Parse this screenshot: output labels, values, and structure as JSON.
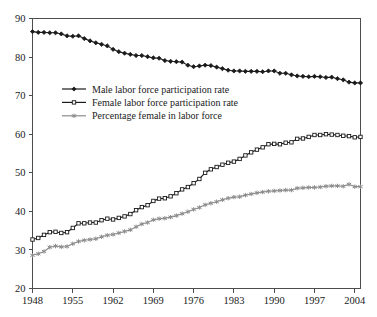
{
  "chart_data": {
    "type": "line",
    "title": "",
    "subtitle": "",
    "xlabel": "",
    "ylabel": "",
    "xlim": [
      1948,
      2005
    ],
    "ylim": [
      20,
      90
    ],
    "grid": false,
    "legend_position": "inside-upper-left",
    "x_ticks": [
      "1948",
      "1955",
      "1962",
      "1969",
      "1976",
      "1983",
      "1990",
      "1997",
      "2004"
    ],
    "x_tick_values": [
      1948,
      1955,
      1962,
      1969,
      1976,
      1983,
      1990,
      1997,
      2004
    ],
    "y_ticks": [
      "20",
      "30",
      "40",
      "50",
      "60",
      "70",
      "80",
      "90"
    ],
    "y_tick_values": [
      20,
      30,
      40,
      50,
      60,
      70,
      80,
      90
    ],
    "x": [
      1948,
      1949,
      1950,
      1951,
      1952,
      1953,
      1954,
      1955,
      1956,
      1957,
      1958,
      1959,
      1960,
      1961,
      1962,
      1963,
      1964,
      1965,
      1966,
      1967,
      1968,
      1969,
      1970,
      1971,
      1972,
      1973,
      1974,
      1975,
      1976,
      1977,
      1978,
      1979,
      1980,
      1981,
      1982,
      1983,
      1984,
      1985,
      1986,
      1987,
      1988,
      1989,
      1990,
      1991,
      1992,
      1993,
      1994,
      1995,
      1996,
      1997,
      1998,
      1999,
      2000,
      2001,
      2002,
      2003,
      2004,
      2005
    ],
    "series": [
      {
        "name": "Male labor force participation rate",
        "marker": "filled-diamond",
        "color": "#1a1a1a",
        "values": [
          86.6,
          86.4,
          86.4,
          86.3,
          86.3,
          86.0,
          85.5,
          85.4,
          85.5,
          84.8,
          84.2,
          83.7,
          83.3,
          82.9,
          82.0,
          81.4,
          81.0,
          80.7,
          80.4,
          80.4,
          80.1,
          79.8,
          79.7,
          79.1,
          78.9,
          78.8,
          78.7,
          77.9,
          77.5,
          77.7,
          77.9,
          77.8,
          77.4,
          77.0,
          76.6,
          76.4,
          76.4,
          76.3,
          76.3,
          76.3,
          76.2,
          76.4,
          76.4,
          75.8,
          75.8,
          75.4,
          75.1,
          75.0,
          74.9,
          75.0,
          74.9,
          74.7,
          74.8,
          74.4,
          74.1,
          73.5,
          73.3,
          73.3
        ]
      },
      {
        "name": "Female labor force participation rate",
        "marker": "open-square",
        "color": "#1a1a1a",
        "values": [
          32.7,
          33.1,
          33.9,
          34.6,
          34.7,
          34.4,
          34.6,
          35.7,
          36.9,
          36.9,
          37.1,
          37.1,
          37.7,
          38.1,
          37.9,
          38.3,
          38.7,
          39.3,
          40.3,
          41.1,
          41.6,
          42.7,
          43.3,
          43.4,
          43.9,
          44.7,
          45.7,
          46.3,
          47.3,
          48.4,
          50.0,
          50.9,
          51.5,
          52.1,
          52.6,
          52.9,
          53.6,
          54.5,
          55.3,
          56.0,
          56.6,
          57.4,
          57.5,
          57.4,
          57.8,
          57.9,
          58.8,
          58.9,
          59.3,
          59.8,
          59.8,
          60.0,
          59.9,
          59.8,
          59.6,
          59.5,
          59.2,
          59.3
        ]
      },
      {
        "name": "Percentage female in labor force",
        "marker": "gray-star",
        "color": "#8c8c8c",
        "values": [
          28.6,
          29.0,
          29.6,
          30.7,
          31.0,
          30.8,
          30.9,
          31.6,
          32.2,
          32.5,
          32.7,
          32.9,
          33.4,
          33.8,
          34.0,
          34.4,
          34.8,
          35.2,
          36.0,
          36.7,
          37.1,
          37.8,
          38.1,
          38.2,
          38.5,
          38.9,
          39.4,
          39.9,
          40.5,
          41.0,
          41.7,
          42.1,
          42.5,
          43.0,
          43.4,
          43.7,
          43.8,
          44.2,
          44.5,
          44.8,
          45.0,
          45.2,
          45.3,
          45.4,
          45.5,
          45.5,
          46.0,
          46.1,
          46.2,
          46.2,
          46.3,
          46.5,
          46.6,
          46.6,
          46.5,
          47.0,
          46.4,
          46.4
        ]
      }
    ],
    "legend": [
      "Male labor force participation rate",
      "Female labor force participation rate",
      "Percentage female in labor force"
    ]
  },
  "colors": {
    "axis": "#4d4d4d",
    "text": "#1a1a1a",
    "male": "#1a1a1a",
    "female": "#1a1a1a",
    "percent_female": "#8c8c8c",
    "background": "#ffffff"
  }
}
